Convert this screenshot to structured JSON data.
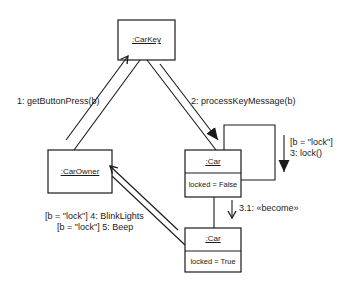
{
  "diagram": {
    "type": "UML communication diagram",
    "objects": [
      {
        "id": "carkey",
        "name": ":CarKey"
      },
      {
        "id": "carowner",
        "name": ":CarOwner"
      },
      {
        "id": "car_unlocked",
        "name": ":Car",
        "attribute": "locked = False"
      },
      {
        "id": "car_locked",
        "name": ":Car",
        "attribute": "locked = True"
      }
    ],
    "messages": [
      {
        "label": "1: getButtonPress(b)",
        "from": "carowner",
        "to": "carkey"
      },
      {
        "label": "2: processKeyMessage(b)",
        "from": "carkey",
        "to": "car_unlocked"
      },
      {
        "guard": "[b = \"lock\"]",
        "label": "3: lock()",
        "from": "car_unlocked",
        "to": "car_unlocked"
      },
      {
        "label": "3.1: «become»",
        "from": "car_unlocked",
        "to": "car_locked"
      },
      {
        "label": "[b = \"lock\"] 4: BlinkLights",
        "from": "car_locked",
        "to": "carowner"
      },
      {
        "label": "[b = \"lock\"] 5: Beep",
        "from": "car_locked",
        "to": "carowner"
      }
    ]
  }
}
